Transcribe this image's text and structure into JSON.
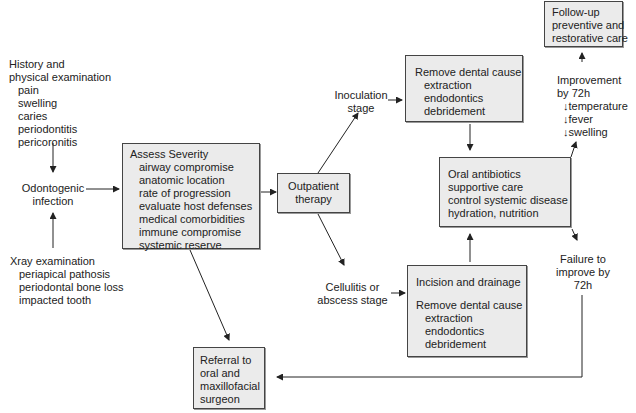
{
  "history": {
    "title": [
      "History and",
      "physical examination"
    ],
    "items": [
      "pain",
      "swelling",
      "caries",
      "periodontitis",
      "pericoronitis"
    ]
  },
  "odontogenic": [
    "Odontogenic",
    "infection"
  ],
  "xray": {
    "title": "Xray examination",
    "items": [
      "periapical pathosis",
      "periodontal bone loss",
      "impacted tooth"
    ]
  },
  "assess": {
    "title": "Assess Severity",
    "items": [
      "airway compromise",
      "anatomic location",
      "rate of progression",
      "evaluate host defenses",
      "medical comorbidities",
      "immune compromise",
      "systemic reserve"
    ]
  },
  "outpatient": [
    "Outpatient",
    "therapy"
  ],
  "inoculation": [
    "Inoculation",
    "stage"
  ],
  "cellulitis": [
    "Cellulitis or",
    "abscess stage"
  ],
  "remove_top": {
    "title": "Remove dental cause",
    "items": [
      "extraction",
      "endodontics",
      "debridement"
    ]
  },
  "oral_antibiotics": [
    "Oral antibiotics",
    "supportive care",
    "control systemic disease",
    "hydration, nutrition"
  ],
  "incision": {
    "title": "Incision and drainage",
    "subtitle": "Remove dental cause",
    "items": [
      "extraction",
      "endodontics",
      "debridement"
    ]
  },
  "improvement": {
    "title": [
      "Improvement",
      "by 72h"
    ],
    "items": [
      "↓temperature",
      "↓fever",
      "↓swelling"
    ]
  },
  "followup": [
    "Follow-up",
    "preventive and",
    "restorative care"
  ],
  "failure": [
    "Failure to",
    "improve by",
    "72h"
  ],
  "referral": [
    "Referral to",
    "oral and",
    "maxillofacial",
    "surgeon"
  ],
  "colors": {
    "box_fill": "#ebebeb",
    "border": "#444444",
    "text": "#222222"
  }
}
